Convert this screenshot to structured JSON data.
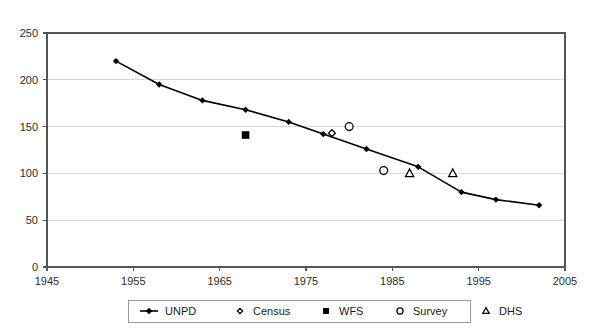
{
  "chart_data": {
    "type": "scatter",
    "title": "",
    "xlabel": "",
    "ylabel": "",
    "xlim": [
      1945,
      2005
    ],
    "ylim": [
      0,
      250
    ],
    "grid": true,
    "legend_position": "bottom",
    "x_ticks": [
      "1945",
      "1955",
      "1965",
      "1975",
      "1985",
      "1995",
      "2005"
    ],
    "x_tick_values": [
      1945,
      1955,
      1965,
      1975,
      1985,
      1995,
      2005
    ],
    "y_ticks": [
      "0",
      "50",
      "100",
      "150",
      "200",
      "250"
    ],
    "y_tick_values": [
      0,
      50,
      100,
      150,
      200,
      250
    ],
    "series": [
      {
        "name": "UNPD",
        "marker": "line-diamond",
        "style": "line",
        "points": [
          [
            1953,
            220
          ],
          [
            1958,
            195
          ],
          [
            1963,
            178
          ],
          [
            1968,
            168
          ],
          [
            1973,
            155
          ],
          [
            1977,
            142
          ],
          [
            1982,
            126
          ],
          [
            1988,
            107
          ],
          [
            1993,
            80
          ],
          [
            1997,
            72
          ],
          [
            2002,
            66
          ]
        ]
      },
      {
        "name": "Census",
        "marker": "open-diamond",
        "style": "points",
        "points": [
          [
            1978,
            143
          ]
        ]
      },
      {
        "name": "WFS",
        "marker": "filled-square",
        "style": "points",
        "points": [
          [
            1968,
            141
          ]
        ]
      },
      {
        "name": "Survey",
        "marker": "open-circle",
        "style": "points",
        "points": [
          [
            1980,
            150
          ],
          [
            1984,
            103
          ]
        ]
      },
      {
        "name": "DHS",
        "marker": "open-triangle",
        "style": "points",
        "points": [
          [
            1987,
            100
          ],
          [
            1992,
            100
          ]
        ]
      }
    ],
    "legend": [
      {
        "label": "UNPD",
        "marker": "line-diamond"
      },
      {
        "label": "Census",
        "marker": "open-diamond"
      },
      {
        "label": "WFS",
        "marker": "filled-square"
      },
      {
        "label": "Survey",
        "marker": "open-circle"
      },
      {
        "label": "DHS",
        "marker": "open-triangle"
      }
    ],
    "colors": {
      "series": "#000000",
      "grid": "#d9d9d9",
      "axis": "#555555",
      "background": "#ffffff"
    }
  }
}
